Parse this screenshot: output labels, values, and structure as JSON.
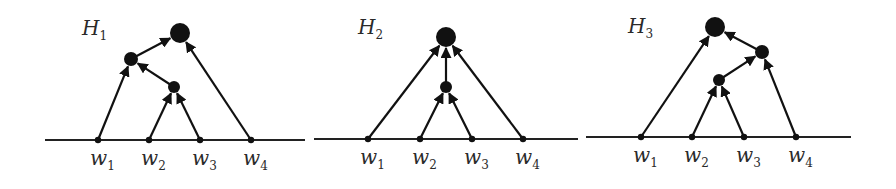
{
  "figure": {
    "colors": {
      "ink": "#111111",
      "background": "#ffffff"
    },
    "panels": [
      {
        "id": "H1",
        "title": {
          "main": "H",
          "sub": "1",
          "x": 82,
          "y": 35
        },
        "baseline": {
          "x1": 45,
          "x2": 305,
          "y": 140
        },
        "leaves": [
          {
            "main": "w",
            "sub": "1",
            "x": 98
          },
          {
            "main": "w",
            "sub": "2",
            "x": 149
          },
          {
            "main": "w",
            "sub": "3",
            "x": 200
          },
          {
            "main": "w",
            "sub": "4",
            "x": 251
          }
        ],
        "nodes": [
          {
            "id": "root",
            "x": 180,
            "y": 33,
            "r": 10
          },
          {
            "id": "n12_34",
            "x": 131,
            "y": 59,
            "r": 7
          },
          {
            "id": "n23",
            "x": 174,
            "y": 87,
            "r": 6
          }
        ],
        "edges": [
          {
            "from": "w1",
            "to": "n12_34"
          },
          {
            "from": "w2",
            "to": "n23"
          },
          {
            "from": "w3",
            "to": "n23"
          },
          {
            "from": "n23",
            "to": "n12_34"
          },
          {
            "from": "n12_34",
            "to": "root"
          },
          {
            "from": "w4",
            "to": "root"
          }
        ]
      },
      {
        "id": "H2",
        "title": {
          "main": "H",
          "sub": "2",
          "x": 358,
          "y": 34
        },
        "baseline": {
          "x1": 314,
          "x2": 578,
          "y": 139
        },
        "leaves": [
          {
            "main": "w",
            "sub": "1",
            "x": 368
          },
          {
            "main": "w",
            "sub": "2",
            "x": 420
          },
          {
            "main": "w",
            "sub": "3",
            "x": 472
          },
          {
            "main": "w",
            "sub": "4",
            "x": 523
          }
        ],
        "nodes": [
          {
            "id": "root",
            "x": 446,
            "y": 37,
            "r": 10
          },
          {
            "id": "n23",
            "x": 446,
            "y": 87,
            "r": 6
          }
        ],
        "edges": [
          {
            "from": "w1",
            "to": "root"
          },
          {
            "from": "w2",
            "to": "n23"
          },
          {
            "from": "w3",
            "to": "n23"
          },
          {
            "from": "n23",
            "to": "root"
          },
          {
            "from": "w4",
            "to": "root"
          }
        ]
      },
      {
        "id": "H3",
        "title": {
          "main": "H",
          "sub": "3",
          "x": 628,
          "y": 33
        },
        "baseline": {
          "x1": 586,
          "x2": 851,
          "y": 137
        },
        "leaves": [
          {
            "main": "w",
            "sub": "1",
            "x": 641
          },
          {
            "main": "w",
            "sub": "2",
            "x": 692
          },
          {
            "main": "w",
            "sub": "3",
            "x": 744
          },
          {
            "main": "w",
            "sub": "4",
            "x": 796
          }
        ],
        "nodes": [
          {
            "id": "root",
            "x": 715,
            "y": 27,
            "r": 10
          },
          {
            "id": "n234",
            "x": 762,
            "y": 52,
            "r": 7
          },
          {
            "id": "n23",
            "x": 719,
            "y": 80,
            "r": 6
          }
        ],
        "edges": [
          {
            "from": "w1",
            "to": "root"
          },
          {
            "from": "w2",
            "to": "n23"
          },
          {
            "from": "w3",
            "to": "n23"
          },
          {
            "from": "n23",
            "to": "n234"
          },
          {
            "from": "w4",
            "to": "n234"
          },
          {
            "from": "n234",
            "to": "root"
          }
        ]
      }
    ]
  }
}
